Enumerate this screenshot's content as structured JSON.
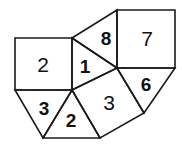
{
  "figure": {
    "kind": "geometric-tiling-diagram",
    "canvas": {
      "width": 182,
      "height": 150
    },
    "style": {
      "stroke_color": "#1a1a1a",
      "fill_color": "#ffffff",
      "background_color": "#ffffff",
      "stroke_width": 1.6,
      "label_color": "#111111"
    },
    "regions": [
      {
        "id": "square-left",
        "label": "2",
        "shape": "square",
        "weight": "regular",
        "font_size": 21,
        "points": "15,38 72,38 72,90 15,90",
        "label_x": 43,
        "label_y": 64
      },
      {
        "id": "triangle-one",
        "label": "1",
        "shape": "triangle",
        "weight": "bold",
        "font_size": 19,
        "points": "72,38 117,68 72,90",
        "label_x": 85,
        "label_y": 66
      },
      {
        "id": "triangle-eight",
        "label": "8",
        "shape": "triangle",
        "weight": "bold",
        "font_size": 19,
        "points": "72,38 117,10 117,68",
        "label_x": 106,
        "label_y": 38
      },
      {
        "id": "square-seven",
        "label": "7",
        "shape": "square",
        "weight": "regular",
        "font_size": 21,
        "points": "117,10 175,10 175,68 117,68",
        "label_x": 147,
        "label_y": 38
      },
      {
        "id": "triangle-six",
        "label": "6",
        "shape": "triangle",
        "weight": "bold",
        "font_size": 19,
        "points": "117,68 175,68 144,113",
        "label_x": 146,
        "label_y": 84
      },
      {
        "id": "square-center",
        "label": "3",
        "shape": "square",
        "weight": "regular",
        "font_size": 21,
        "points": "72,90 117,68 144,113 100,138",
        "label_x": 109,
        "label_y": 102
      },
      {
        "id": "triangle-three",
        "label": "3",
        "shape": "triangle",
        "weight": "bold",
        "font_size": 19,
        "points": "15,90 72,90 43,138",
        "label_x": 44,
        "label_y": 108
      },
      {
        "id": "triangle-two",
        "label": "2",
        "shape": "triangle",
        "weight": "bold",
        "font_size": 19,
        "points": "72,90 100,138 43,138",
        "label_x": 71,
        "label_y": 120
      }
    ]
  }
}
